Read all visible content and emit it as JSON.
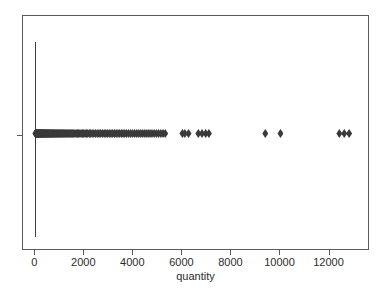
{
  "chart_data": {
    "type": "scatter",
    "title": "",
    "subtitle": "",
    "xlabel": "quantity",
    "ylabel": "",
    "xlim": [
      -500,
      13650
    ],
    "ylim": [
      0,
      1
    ],
    "grid": false,
    "legend": null,
    "annotations": [],
    "xticks": [
      0,
      2000,
      4000,
      6000,
      8000,
      10000,
      12000
    ],
    "xticklabels": [
      "0",
      "2000",
      "4000",
      "6000",
      "8000",
      "10000",
      "12000"
    ],
    "yticks": [
      0.5
    ],
    "yticklabels": [
      ""
    ],
    "marker": "diamond",
    "marker_color": "#3a3a3a",
    "frame_color": "#5a5a5a",
    "range_line": {
      "x": 0,
      "y_low": 0.06,
      "y_high": 0.89,
      "color": "#3c3c3c"
    },
    "x": [
      5,
      10,
      18,
      25,
      30,
      38,
      45,
      50,
      60,
      70,
      80,
      90,
      100,
      110,
      120,
      130,
      140,
      150,
      160,
      175,
      190,
      200,
      215,
      230,
      245,
      260,
      275,
      290,
      305,
      320,
      335,
      350,
      365,
      380,
      400,
      420,
      440,
      460,
      480,
      500,
      520,
      540,
      560,
      580,
      600,
      625,
      650,
      675,
      700,
      725,
      750,
      775,
      800,
      830,
      860,
      890,
      920,
      950,
      980,
      1010,
      1040,
      1075,
      1110,
      1145,
      1180,
      1215,
      1250,
      1290,
      1330,
      1370,
      1410,
      1450,
      1490,
      1530,
      1570,
      1620,
      1670,
      1720,
      1770,
      1820,
      1870,
      1920,
      1975,
      2030,
      2085,
      2140,
      2200,
      2260,
      2320,
      2390,
      2460,
      2530,
      2600,
      2670,
      2740,
      2810,
      2880,
      2950,
      3020,
      3090,
      3160,
      3230,
      3300,
      3370,
      3440,
      3510,
      3580,
      3650,
      3720,
      3800,
      3880,
      3960,
      4040,
      4120,
      4200,
      4280,
      4360,
      4440,
      4520,
      4600,
      4680,
      4760,
      4850,
      4940,
      5030,
      5120,
      5210,
      5300,
      6000,
      6100,
      6250,
      6650,
      6800,
      6950,
      7080,
      9380,
      10000,
      12400,
      12600,
      12800
    ],
    "y": [
      0.5,
      0.5,
      0.5,
      0.5,
      0.5,
      0.5,
      0.5,
      0.5,
      0.5,
      0.5,
      0.5,
      0.5,
      0.5,
      0.5,
      0.5,
      0.5,
      0.5,
      0.5,
      0.5,
      0.5,
      0.5,
      0.5,
      0.5,
      0.5,
      0.5,
      0.5,
      0.5,
      0.5,
      0.5,
      0.5,
      0.5,
      0.5,
      0.5,
      0.5,
      0.5,
      0.5,
      0.5,
      0.5,
      0.5,
      0.5,
      0.5,
      0.5,
      0.5,
      0.5,
      0.5,
      0.5,
      0.5,
      0.5,
      0.5,
      0.5,
      0.5,
      0.5,
      0.5,
      0.5,
      0.5,
      0.5,
      0.5,
      0.5,
      0.5,
      0.5,
      0.5,
      0.5,
      0.5,
      0.5,
      0.5,
      0.5,
      0.5,
      0.5,
      0.5,
      0.5,
      0.5,
      0.5,
      0.5,
      0.5,
      0.5,
      0.5,
      0.5,
      0.5,
      0.5,
      0.5,
      0.5,
      0.5,
      0.5,
      0.5,
      0.5,
      0.5,
      0.5,
      0.5,
      0.5,
      0.5,
      0.5,
      0.5,
      0.5,
      0.5,
      0.5,
      0.5,
      0.5,
      0.5,
      0.5,
      0.5,
      0.5,
      0.5,
      0.5,
      0.5,
      0.5,
      0.5,
      0.5,
      0.5,
      0.5,
      0.5,
      0.5,
      0.5,
      0.5,
      0.5,
      0.5,
      0.5,
      0.5,
      0.5,
      0.5,
      0.5,
      0.5,
      0.5,
      0.5,
      0.5,
      0.5,
      0.5,
      0.5,
      0.5,
      0.5,
      0.5,
      0.5,
      0.5,
      0.5,
      0.5,
      0.5,
      0.5,
      0.5,
      0.5,
      0.5,
      0.5
    ]
  }
}
